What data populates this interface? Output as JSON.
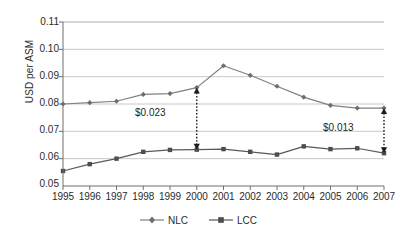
{
  "chart_data": {
    "type": "line",
    "title": "",
    "xlabel": "",
    "ylabel": "USD per ASM",
    "categories": [
      "1995",
      "1996",
      "1997",
      "1998",
      "1999",
      "2000",
      "2001",
      "2002",
      "2003",
      "2004",
      "2005",
      "2006",
      "2007"
    ],
    "x": [
      1995,
      1996,
      1997,
      1998,
      1999,
      2000,
      2001,
      2002,
      2003,
      2004,
      2005,
      2006,
      2007
    ],
    "ylim": [
      0.05,
      0.11
    ],
    "yticks": [
      "0.05",
      "0.06",
      "0.07",
      "0.08",
      "0.09",
      "0.10",
      "0.11"
    ],
    "ytick_values": [
      0.05,
      0.06,
      0.07,
      0.08,
      0.09,
      0.1,
      0.11
    ],
    "grid": "horizontal",
    "legend_position": "bottom-center",
    "series": [
      {
        "name": "NLC",
        "marker": "diamond",
        "color": "#808080",
        "values": [
          0.08,
          0.0805,
          0.081,
          0.0835,
          0.0838,
          0.086,
          0.094,
          0.0905,
          0.0865,
          0.0825,
          0.0795,
          0.0785,
          0.0785
        ]
      },
      {
        "name": "LCC",
        "marker": "square",
        "color": "#595959",
        "values": [
          0.0555,
          0.058,
          0.06,
          0.0625,
          0.0632,
          0.0633,
          0.0635,
          0.0625,
          0.0615,
          0.0645,
          0.0635,
          0.0638,
          0.062
        ]
      }
    ],
    "annotations": [
      {
        "label": "$0.023",
        "at_category": "2000",
        "from_series": "NLC",
        "to_series": "LCC",
        "style": "double-headed-dotted-arrow"
      },
      {
        "label": "$0.013",
        "at_category": "2007",
        "from_series": "NLC",
        "to_series": "LCC",
        "style": "double-headed-dotted-arrow"
      }
    ]
  },
  "legend": {
    "items": [
      {
        "label": "NLC"
      },
      {
        "label": "LCC"
      }
    ]
  },
  "colors": {
    "nlc": "#808080",
    "lcc": "#595959",
    "grid": "#c9c9c9",
    "axis": "#6e6e6e",
    "annotation": "#1d1d1d"
  }
}
